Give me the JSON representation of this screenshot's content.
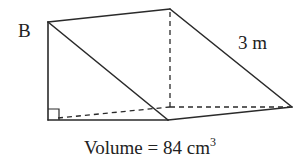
{
  "diagram": {
    "type": "triangular-prism",
    "labels": {
      "vertex": "B",
      "edge_length": "3 m",
      "volume_prefix": "Volume = 84 cm",
      "volume_exponent": "3"
    },
    "colors": {
      "stroke": "#2a2a2a",
      "text": "#222222",
      "background": "#ffffff"
    }
  }
}
